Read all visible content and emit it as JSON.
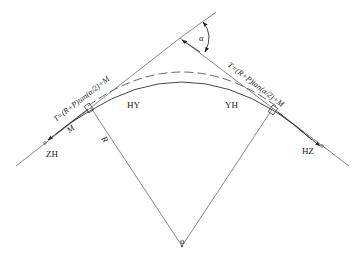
{
  "diagram": {
    "type": "highway transition curve (spiral) layout",
    "labels": {
      "zh": "ZH",
      "hz": "HZ",
      "hy": "HY",
      "yh": "YH",
      "alpha": "α",
      "radius": "R",
      "m_left": "M",
      "center_mark": "o"
    },
    "formulas": {
      "left_tangent": "T=(R+P)tan(α/2)+M",
      "right_tangent": "T=(R+P)tan(α/2)+M"
    },
    "elements": {
      "tangent_lines": 2,
      "main_curve": "solid arc HY–YH with spiral ends",
      "shifted_curve": "dashed arc",
      "radius_lines": 2,
      "deflection_angle": "α"
    },
    "colors": {
      "line": "#6a6a6a",
      "text": "#222222",
      "background": "#ffffff"
    }
  },
  "caption": {
    "text": ""
  }
}
